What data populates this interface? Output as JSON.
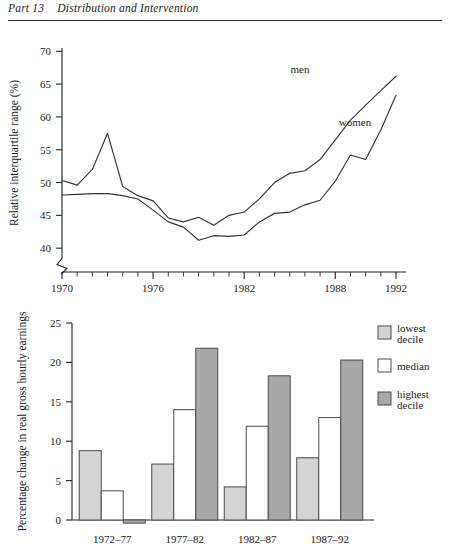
{
  "runninghead": {
    "part": "Part 13",
    "title": "Distribution and Intervention"
  },
  "chart_data": [
    {
      "type": "line",
      "title": "",
      "xlabel": "Year",
      "ylabel": "Relative interquartile range (%)",
      "xlim": [
        1970,
        1992
      ],
      "ylim": [
        38,
        70
      ],
      "yticks": [
        40,
        45,
        50,
        55,
        60,
        65,
        70
      ],
      "xticks": [
        1970,
        1976,
        1982,
        1988,
        1992
      ],
      "xtick_minor_step": 1,
      "axis_break": true,
      "grid": false,
      "legend": "inline-labels",
      "x": [
        1970,
        1971,
        1972,
        1973,
        1974,
        1975,
        1976,
        1977,
        1978,
        1979,
        1980,
        1981,
        1982,
        1983,
        1984,
        1985,
        1986,
        1987,
        1988,
        1989,
        1990,
        1991,
        1992
      ],
      "series": [
        {
          "name": "men",
          "label": "men",
          "values": [
            50.3,
            49.6,
            52.0,
            57.5,
            49.4,
            48.0,
            47.2,
            44.6,
            44.0,
            44.7,
            43.5,
            45.0,
            45.5,
            47.5,
            50.0,
            51.4,
            51.8,
            53.5,
            56.5,
            59.5,
            61.8,
            64.0,
            66.2
          ]
        },
        {
          "name": "women",
          "label": "women",
          "values": [
            48.1,
            48.2,
            48.3,
            48.3,
            48.0,
            47.5,
            45.8,
            44.0,
            43.2,
            41.2,
            41.9,
            41.8,
            42.0,
            44.0,
            45.3,
            45.5,
            46.6,
            47.3,
            50.2,
            54.2,
            53.5,
            58.0,
            63.3
          ]
        }
      ]
    },
    {
      "type": "bar",
      "title": "",
      "xlabel": "",
      "ylabel": "Percentage change in real gross hourly earnings",
      "ylim": [
        -1,
        25
      ],
      "yticks": [
        0,
        5,
        10,
        15,
        20,
        25
      ],
      "grid": false,
      "categories": [
        "1972–77",
        "1977–82",
        "1982–87",
        "1987–92"
      ],
      "legend_position": "right",
      "series": [
        {
          "name": "lowest-decile",
          "label": "lowest decile",
          "color": "#d4d4d4",
          "values": [
            8.8,
            7.1,
            4.2,
            7.9
          ]
        },
        {
          "name": "median",
          "label": "median",
          "color": "#ffffff",
          "values": [
            3.7,
            14.0,
            11.9,
            13.0
          ]
        },
        {
          "name": "highest-decile",
          "label": "highest decile",
          "color": "#a8a8a8",
          "values": [
            -0.4,
            21.8,
            18.3,
            20.3
          ]
        }
      ]
    }
  ]
}
